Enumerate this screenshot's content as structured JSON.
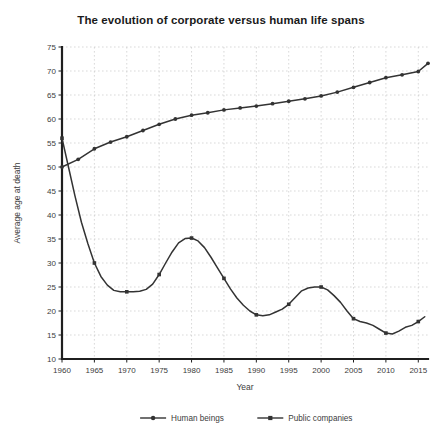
{
  "chart_data": {
    "type": "line",
    "title": "The evolution of corporate versus human life spans",
    "xlabel": "Year",
    "ylabel": "Average age at death",
    "xlim": [
      1960,
      2016.5
    ],
    "ylim": [
      10,
      75
    ],
    "x_ticks": [
      1960,
      1965,
      1970,
      1975,
      1980,
      1985,
      1990,
      1995,
      2000,
      2005,
      2010,
      2015
    ],
    "y_ticks": [
      10,
      15,
      20,
      25,
      30,
      35,
      40,
      45,
      50,
      55,
      60,
      65,
      70,
      75
    ],
    "grid": true,
    "legend_position": "bottom",
    "series": [
      {
        "name": "Human beings",
        "marker": "circle",
        "color": "#333333",
        "x": [
          1960,
          1962.5,
          1965,
          1967.5,
          1970,
          1972.5,
          1975,
          1977.5,
          1980,
          1982.5,
          1985,
          1987.5,
          1990,
          1992.5,
          1995,
          1997.5,
          2000,
          2002.5,
          2005,
          2007.5,
          2010,
          2012.5,
          2015,
          2016.5
        ],
        "values": [
          50.0,
          51.6,
          53.8,
          55.2,
          56.3,
          57.6,
          58.9,
          60.0,
          60.8,
          61.3,
          61.9,
          62.3,
          62.7,
          63.2,
          63.7,
          64.2,
          64.8,
          65.6,
          66.6,
          67.6,
          68.6,
          69.2,
          69.9,
          71.6
        ]
      },
      {
        "name": "Public companies",
        "marker": "square",
        "color": "#333333",
        "x": [
          1960,
          1961,
          1962,
          1963,
          1964,
          1965,
          1966,
          1967,
          1968,
          1969,
          1970,
          1971,
          1972,
          1973,
          1974,
          1975,
          1976,
          1977,
          1978,
          1979,
          1980,
          1981,
          1982,
          1983,
          1984,
          1985,
          1986,
          1987,
          1988,
          1989,
          1990,
          1991,
          1992,
          1993,
          1994,
          1995,
          1996,
          1997,
          1998,
          1999,
          2000,
          2001,
          2002,
          2003,
          2004,
          2005,
          2006,
          2007,
          2008,
          2009,
          2010,
          2011,
          2012,
          2013,
          2014,
          2015,
          2016
        ],
        "values": [
          56.0,
          50.0,
          44.0,
          38.5,
          34.0,
          30.0,
          27.2,
          25.4,
          24.3,
          24.0,
          24.0,
          24.0,
          24.1,
          24.5,
          25.6,
          27.6,
          30.0,
          32.3,
          34.2,
          35.1,
          35.2,
          34.6,
          33.2,
          31.2,
          29.0,
          26.8,
          24.6,
          22.7,
          21.2,
          20.0,
          19.2,
          19.0,
          19.2,
          19.8,
          20.4,
          21.4,
          22.8,
          24.2,
          24.8,
          25.0,
          25.0,
          24.4,
          23.2,
          21.8,
          20.0,
          18.4,
          17.8,
          17.5,
          17.0,
          16.2,
          15.4,
          15.2,
          15.8,
          16.6,
          17.0,
          17.8,
          18.8
        ]
      }
    ]
  },
  "legend": {
    "items": [
      {
        "label": "Human beings"
      },
      {
        "label": "Public companies"
      }
    ]
  }
}
